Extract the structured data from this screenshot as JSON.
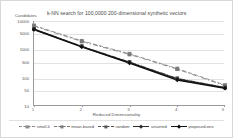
{
  "chart_data": {
    "type": "line",
    "title": "k-NN search for 100,0000 200-dimensional synthetic vectors",
    "xlabel": "Reduced Dimensionality",
    "ylabel": "Candidates",
    "yscale": "log",
    "ylim": [
      10,
      10000
    ],
    "xlim": [
      1,
      5
    ],
    "grid": true,
    "legend_position": "bottom",
    "x": [
      1,
      2,
      3,
      4,
      5
    ],
    "xticklabels": [
      "1",
      "2",
      "3",
      "4",
      "5"
    ],
    "yticklabels": [
      "10000",
      "5000",
      "1000",
      "500",
      "100",
      "50",
      "10"
    ],
    "ytickvalues": [
      10000,
      5000,
      1000,
      500,
      100,
      50,
      10
    ],
    "series": [
      {
        "name": "small-k",
        "marker": "square",
        "linestyle": "dashed",
        "color": "#8c8c8c",
        "values": [
          7000,
          2000,
          700,
          210,
          55
        ]
      },
      {
        "name": "mean-based",
        "marker": "square",
        "linestyle": "dashdot",
        "color": "#7a7a7a",
        "values": [
          6600,
          1900,
          660,
          200,
          52
        ]
      },
      {
        "name": "random",
        "marker": "square",
        "linestyle": "dashdot",
        "color": "#555555",
        "values": [
          5200,
          1300,
          360,
          95,
          45
        ]
      },
      {
        "name": "unsorted",
        "marker": "diamond",
        "linestyle": "solid",
        "color": "#2b2b2b",
        "values": [
          5100,
          1250,
          345,
          90,
          44
        ]
      },
      {
        "name": "proposed-one",
        "marker": "diamond",
        "linestyle": "solid",
        "color": "#111111",
        "values": [
          5000,
          1220,
          330,
          82,
          42
        ]
      }
    ]
  },
  "legend": {
    "items": [
      {
        "label": "small-k"
      },
      {
        "label": "mean-based"
      },
      {
        "label": "random"
      },
      {
        "label": "unsorted"
      },
      {
        "label": "proposed-one"
      }
    ]
  }
}
